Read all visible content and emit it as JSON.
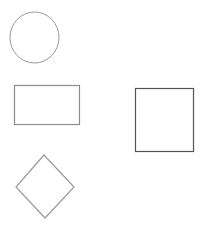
{
  "canvas": {
    "name": "shapes-canvas",
    "width": 204,
    "height": 232,
    "background_color": "#ffffff"
  },
  "shapes": [
    {
      "id": "circle",
      "label": "circle",
      "type": "ellipse",
      "cx": 34.5,
      "cy": 37.5,
      "rx": 24.5,
      "ry": 25.5,
      "stroke_color": "#9a9a9a",
      "stroke_width": 1,
      "fill": "none"
    },
    {
      "id": "rectangle",
      "label": "rectangle",
      "type": "rect",
      "x": 14.5,
      "y": 85.5,
      "width": 65,
      "height": 39,
      "stroke_color": "#8c8c8c",
      "stroke_width": 1.2,
      "fill": "none"
    },
    {
      "id": "square",
      "label": "square",
      "type": "rect",
      "x": 135.5,
      "y": 88.5,
      "width": 58,
      "height": 63,
      "stroke_color": "#555555",
      "stroke_width": 1.2,
      "fill": "none"
    },
    {
      "id": "diamond",
      "label": "diamond",
      "type": "polygon",
      "points": "44,155 74,187 45,218 16,187",
      "stroke_color": "#9a9a9a",
      "stroke_width": 1.2,
      "fill": "none"
    }
  ]
}
